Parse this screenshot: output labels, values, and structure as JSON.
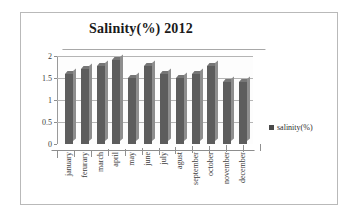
{
  "chart_data": {
    "type": "bar",
    "title": "Salinity(%) 2012",
    "xlabel": "",
    "ylabel": "",
    "categories": [
      "january",
      "ferurary",
      "march",
      "april",
      "may",
      "june",
      "july",
      "agust",
      "september",
      "october",
      "november",
      "december"
    ],
    "series": [
      {
        "name": "salinity(%)",
        "values": [
          1.6,
          1.7,
          1.78,
          1.9,
          1.5,
          1.78,
          1.6,
          1.5,
          1.6,
          1.78,
          1.4,
          1.42
        ]
      }
    ],
    "ylim": [
      0,
      2
    ],
    "yticks": [
      "0",
      "0.5",
      "1",
      "1.5",
      "2"
    ],
    "ytick_values": [
      0,
      0.5,
      1,
      1.5,
      2
    ],
    "grid": true,
    "legend_position": "right",
    "bar_color": "#5d5d5d",
    "border_color": "#b9b9b9"
  },
  "legend": {
    "marker": "square-marker",
    "label": "salinity(%)"
  }
}
